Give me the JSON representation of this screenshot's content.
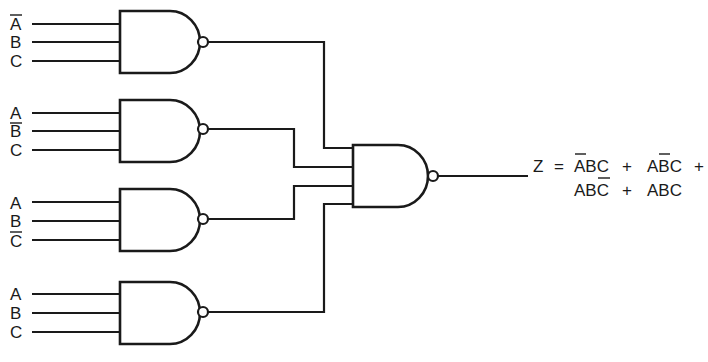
{
  "diagram": {
    "type": "logic-circuit",
    "colors": {
      "ink": "#1a1a1a",
      "background": "#ffffff"
    },
    "gates": [
      {
        "id": "nand-1",
        "inputs": [
          {
            "label": "A",
            "complemented": true
          },
          {
            "label": "B",
            "complemented": false
          },
          {
            "label": "C",
            "complemented": false
          }
        ]
      },
      {
        "id": "nand-2",
        "inputs": [
          {
            "label": "A",
            "complemented": false
          },
          {
            "label": "B",
            "complemented": true
          },
          {
            "label": "C",
            "complemented": false
          }
        ]
      },
      {
        "id": "nand-3",
        "inputs": [
          {
            "label": "A",
            "complemented": false
          },
          {
            "label": "B",
            "complemented": false
          },
          {
            "label": "C",
            "complemented": true
          }
        ]
      },
      {
        "id": "nand-4",
        "inputs": [
          {
            "label": "A",
            "complemented": false
          },
          {
            "label": "B",
            "complemented": false
          },
          {
            "label": "C",
            "complemented": false
          }
        ]
      }
    ],
    "output_gate": {
      "id": "nand-out",
      "input_count": 4
    },
    "output": {
      "variable": "Z",
      "equals": "=",
      "plus": "+",
      "line1_terms": [
        {
          "text": "ABC",
          "bar_over": [
            0
          ]
        },
        {
          "text": "ABC",
          "bar_over": [
            1
          ]
        }
      ],
      "line2_terms": [
        {
          "text": "ABC",
          "bar_over": [
            2
          ]
        },
        {
          "text": "ABC",
          "bar_over": []
        }
      ],
      "full_text": "Z = A'BC + AB'C + ABC' + ABC"
    }
  }
}
